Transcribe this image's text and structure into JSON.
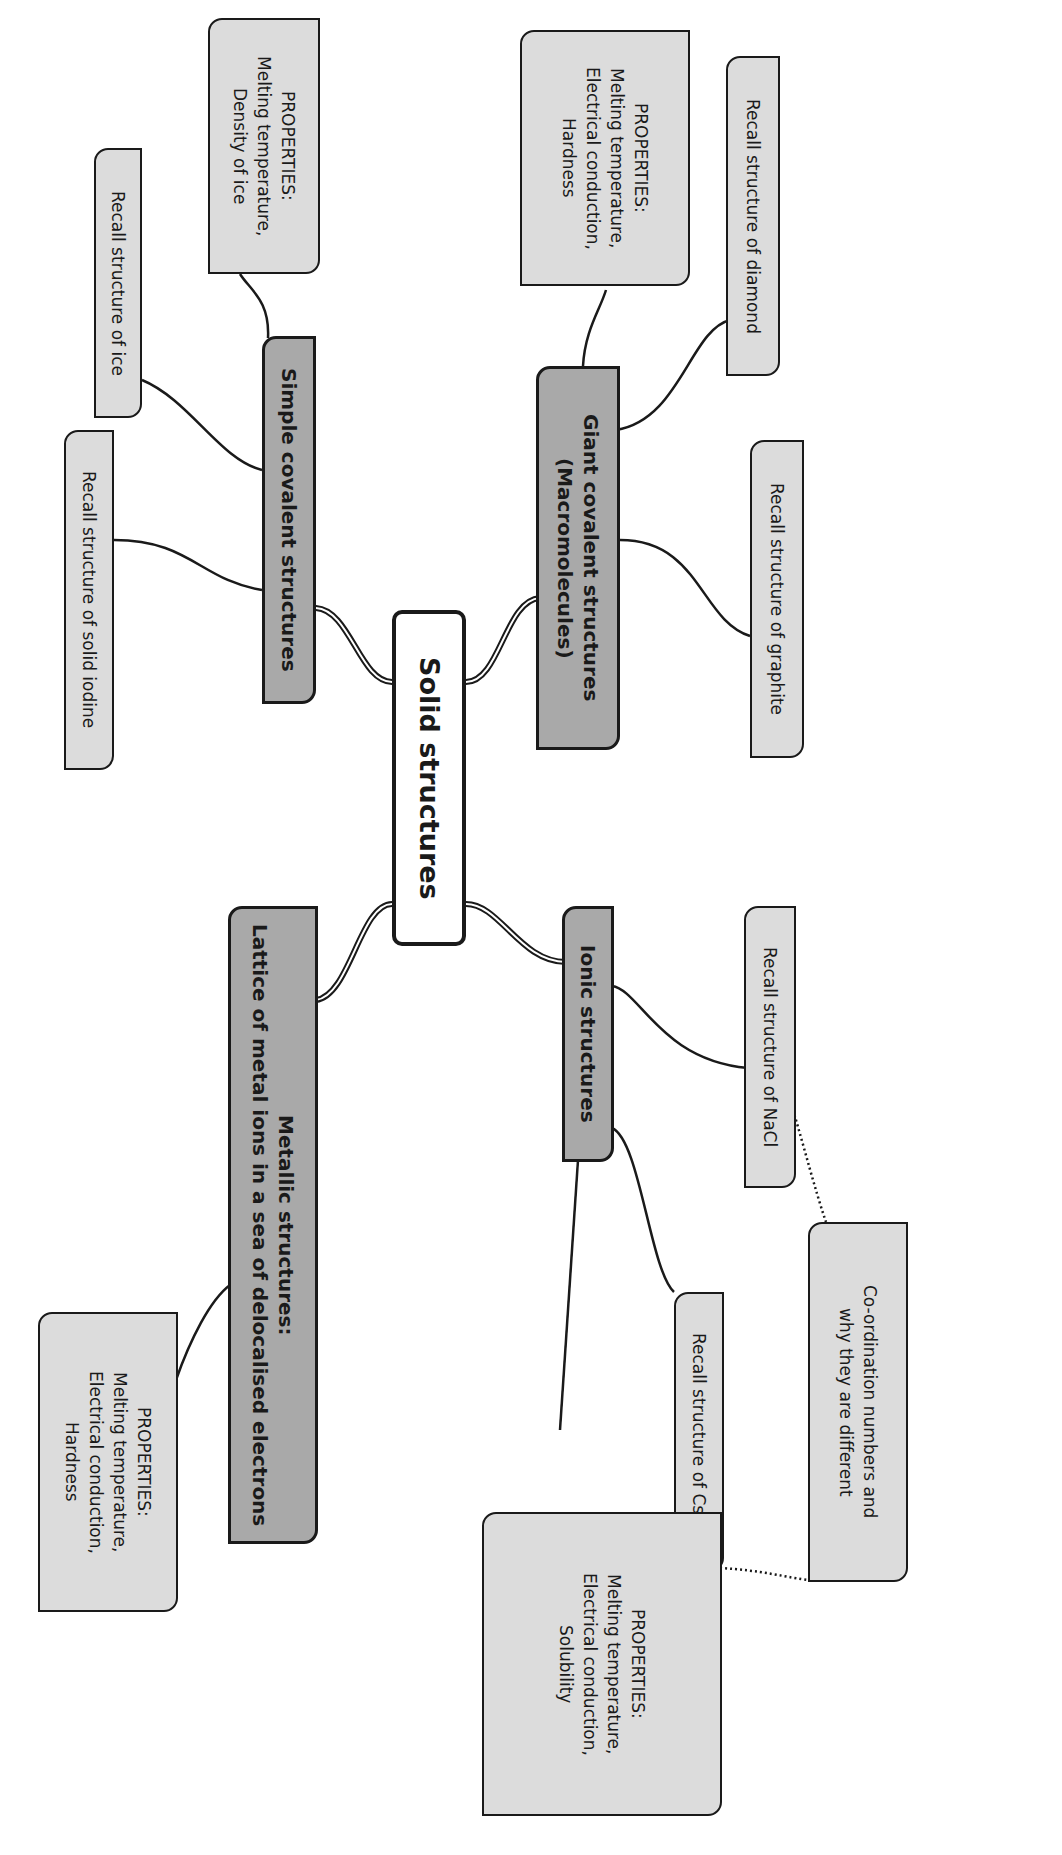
{
  "diagram": {
    "type": "mind-map",
    "orientation": "rotated-90-clockwise",
    "colors": {
      "leaf_fill": "#dcdcdc",
      "branch_fill": "#a9a9a9",
      "root_fill": "#ffffff",
      "stroke": "#1a1a1a"
    },
    "root": {
      "label": "Solid structures"
    },
    "branches": [
      {
        "id": "simple",
        "label": "Simple covalent structures",
        "children": [
          {
            "label": "PROPERTIES:\nMelting temperature,\nDensity of ice"
          },
          {
            "label": "Recall structure of ice"
          },
          {
            "label": "Recall structure of solid iodine"
          }
        ]
      },
      {
        "id": "giant",
        "label": "Giant covalent structures\n(Macromolecules)",
        "children": [
          {
            "label": "PROPERTIES:\nMelting temperature,\nElectrical conduction,\nHardness"
          },
          {
            "label": "Recall structure of diamond"
          },
          {
            "label": "Recall structure of graphite"
          }
        ]
      },
      {
        "id": "ionic",
        "label": "Ionic structures",
        "children": [
          {
            "label": "Recall structure of NaCl"
          },
          {
            "label": "Recall structure of CsCl"
          },
          {
            "label": "PROPERTIES:\nMelting temperature,\nElectrical conduction,\nSolubility"
          }
        ]
      },
      {
        "id": "metallic",
        "label": "Metallic structures:\nLattice of metal ions in a sea of delocalised electrons",
        "children": [
          {
            "label": "PROPERTIES:\nMelting temperature,\nElectrical conduction,\nHardness"
          }
        ]
      }
    ],
    "cross_link": {
      "label": "Co-ordination numbers and\nwhy they are different",
      "style": "dotted",
      "connects": [
        "Recall structure of NaCl",
        "Recall structure of CsCl"
      ]
    }
  }
}
